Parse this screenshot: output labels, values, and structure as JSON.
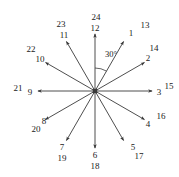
{
  "figure": {
    "center": {
      "x": 95,
      "y": 91
    },
    "ray_length": 57,
    "stroke_color": "#3a3a3a",
    "label_color": "#1a1a1a",
    "angle_annotation": {
      "text": "30°",
      "x": 111,
      "y": 54
    },
    "rays": [
      {
        "inner_label": "1",
        "outer_label": "13",
        "angle_deg": 60,
        "inner_x": 131,
        "inner_y": 33,
        "outer_x": 145,
        "outer_y": 25
      },
      {
        "inner_label": "2",
        "outer_label": "14",
        "angle_deg": 30,
        "inner_x": 148,
        "inner_y": 58,
        "outer_x": 154,
        "outer_y": 48
      },
      {
        "inner_label": "3",
        "outer_label": "15",
        "angle_deg": 0,
        "inner_x": 159,
        "inner_y": 92,
        "outer_x": 169,
        "outer_y": 86
      },
      {
        "inner_label": "4",
        "outer_label": "16",
        "angle_deg": -30,
        "inner_x": 148,
        "inner_y": 124,
        "outer_x": 161,
        "outer_y": 116
      },
      {
        "inner_label": "5",
        "outer_label": "17",
        "angle_deg": -60,
        "inner_x": 133,
        "inner_y": 147,
        "outer_x": 139,
        "outer_y": 156
      },
      {
        "inner_label": "6",
        "outer_label": "18",
        "angle_deg": -90,
        "inner_x": 95,
        "inner_y": 155,
        "outer_x": 95,
        "outer_y": 166
      },
      {
        "inner_label": "7",
        "outer_label": "19",
        "angle_deg": -120,
        "inner_x": 62,
        "inner_y": 147,
        "outer_x": 62,
        "outer_y": 158
      },
      {
        "inner_label": "8",
        "outer_label": "20",
        "angle_deg": -150,
        "inner_x": 44,
        "inner_y": 121,
        "outer_x": 36,
        "outer_y": 129
      },
      {
        "inner_label": "9",
        "outer_label": "21",
        "angle_deg": 180,
        "inner_x": 30,
        "inner_y": 92,
        "outer_x": 18,
        "outer_y": 88
      },
      {
        "inner_label": "10",
        "outer_label": "22",
        "angle_deg": 150,
        "inner_x": 40,
        "inner_y": 59,
        "outer_x": 31,
        "outer_y": 49
      },
      {
        "inner_label": "11",
        "outer_label": "23",
        "angle_deg": 120,
        "inner_x": 64,
        "inner_y": 35,
        "outer_x": 61,
        "outer_y": 24
      },
      {
        "inner_label": "12",
        "outer_label": "24",
        "angle_deg": 90,
        "inner_x": 95,
        "inner_y": 28,
        "outer_x": 96,
        "outer_y": 17
      }
    ]
  }
}
